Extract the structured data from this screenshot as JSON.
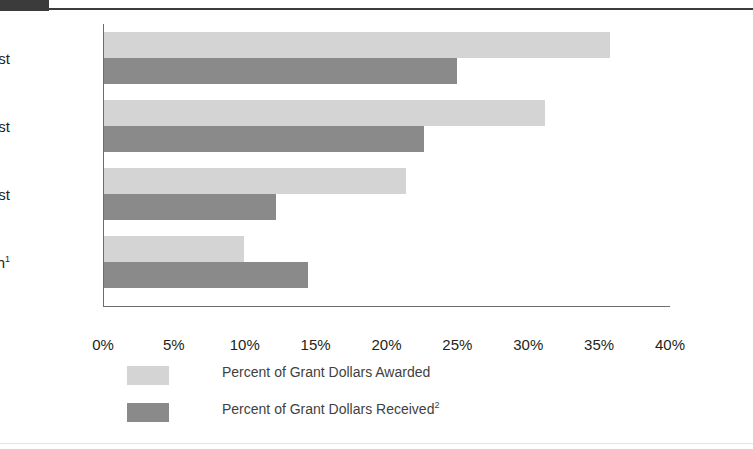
{
  "header": {
    "tab_label": ""
  },
  "chart_data": {
    "type": "bar",
    "orientation": "horizontal",
    "title": "",
    "xlabel": "",
    "ylabel": "",
    "xlim": [
      0,
      40
    ],
    "xtick_labels": [
      "0%",
      "5%",
      "10%",
      "15%",
      "20%",
      "25%",
      "30%",
      "35%",
      "40%"
    ],
    "xticks": [
      0,
      5,
      10,
      15,
      20,
      25,
      30,
      35,
      40
    ],
    "grid": false,
    "legend_position": "bottom-left",
    "categories": [
      "Northeast",
      "West",
      "Midwest",
      "South"
    ],
    "category_labels": [
      "Northeast",
      "West",
      "Midwest",
      "South"
    ],
    "category_footnotes": [
      "",
      "",
      "",
      "1"
    ],
    "series": [
      {
        "name": "Percent of Grant Dollars Awarded",
        "footnote": "",
        "color": "#d4d4d4",
        "values": [
          35.7,
          31.1,
          21.3,
          9.9
        ]
      },
      {
        "name": "Percent of Grant Dollars Received",
        "footnote": "2",
        "color": "#8a8a8a",
        "values": [
          24.9,
          22.6,
          12.1,
          14.4
        ]
      }
    ]
  },
  "axis": {
    "tick_0": "0%",
    "tick_1": "5%",
    "tick_2": "10%",
    "tick_3": "15%",
    "tick_4": "20%",
    "tick_5": "25%",
    "tick_6": "30%",
    "tick_7": "35%",
    "tick_8": "40%"
  },
  "categories": {
    "northeast": "Northeast",
    "west": "West",
    "midwest": "Midwest",
    "south": "South",
    "south_footnote": "1"
  },
  "legend": {
    "awarded_label": "Percent of Grant Dollars Awarded",
    "received_label": "Percent of Grant Dollars Received",
    "received_footnote": "2"
  },
  "colors": {
    "awarded": "#d4d4d4",
    "received": "#8a8a8a",
    "axis": "#6d6d6d",
    "text": "#231f20",
    "header_tab": "#3b3b3b"
  }
}
